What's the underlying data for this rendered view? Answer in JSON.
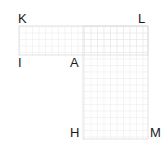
{
  "diagram": {
    "type": "L-shaped region on grid",
    "grid_color": "#e6e6e6",
    "outline_color": "#dcdcdc",
    "cell_size": 6.5,
    "shape": {
      "top_bar": {
        "x": 19,
        "y": 26,
        "w": 129,
        "h": 29
      },
      "vertical_column": {
        "x": 83,
        "y": 26,
        "w": 65,
        "h": 113
      }
    },
    "labels": [
      {
        "id": "K",
        "text": "K",
        "x": 18,
        "y": 12
      },
      {
        "id": "L",
        "text": "L",
        "x": 138,
        "y": 12
      },
      {
        "id": "I",
        "text": "I",
        "x": 18,
        "y": 56
      },
      {
        "id": "A",
        "text": "A",
        "x": 70,
        "y": 56
      },
      {
        "id": "H",
        "text": "H",
        "x": 70,
        "y": 126
      },
      {
        "id": "M",
        "text": "M",
        "x": 150,
        "y": 126
      }
    ]
  }
}
